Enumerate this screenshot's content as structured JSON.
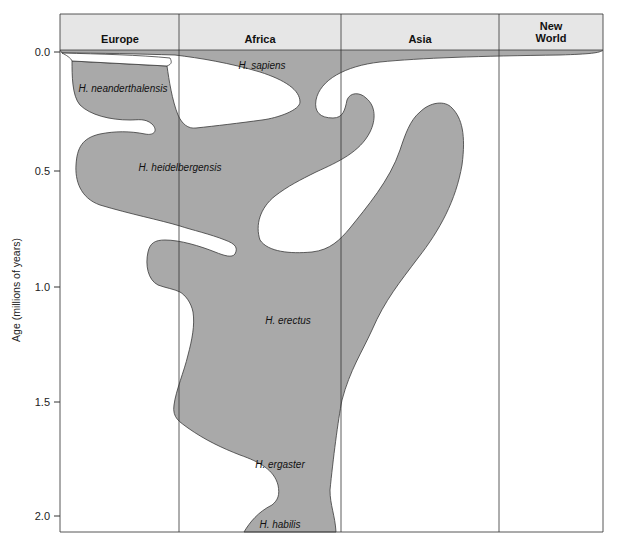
{
  "figure": {
    "type": "phylogeographic diagram",
    "regions": [
      "Europe",
      "Africa",
      "Asia",
      "New World"
    ],
    "y_axis": {
      "label": "Age (millions of years)",
      "ticks": [
        "0.0",
        "0.5",
        "1.0",
        "1.5",
        "2.0"
      ],
      "range": [
        0.0,
        2.05
      ],
      "direction": "increasing downward"
    },
    "species": [
      {
        "name": "H. sapiens",
        "regions": [
          "Europe",
          "Africa",
          "Asia",
          "New World"
        ],
        "time_range_mya": [
          0.0,
          0.2
        ]
      },
      {
        "name": "H. neanderthalensis",
        "regions": [
          "Europe"
        ],
        "time_range_mya": [
          0.03,
          0.35
        ]
      },
      {
        "name": "H. heidelbergensis",
        "regions": [
          "Europe",
          "Africa"
        ],
        "time_range_mya": [
          0.3,
          0.8
        ]
      },
      {
        "name": "H. erectus",
        "regions": [
          "Europe",
          "Africa",
          "Asia"
        ],
        "time_range_mya": [
          0.3,
          1.8
        ]
      },
      {
        "name": "H. ergaster",
        "regions": [
          "Africa"
        ],
        "time_range_mya": [
          1.5,
          1.95
        ]
      },
      {
        "name": "H. habilis",
        "regions": [
          "Africa"
        ],
        "time_range_mya": [
          1.95,
          2.05
        ]
      }
    ]
  },
  "colors": {
    "range_fill": "#a9a9a9",
    "header_fill": "#e6e6e6",
    "outline": "#3a3a3a"
  }
}
